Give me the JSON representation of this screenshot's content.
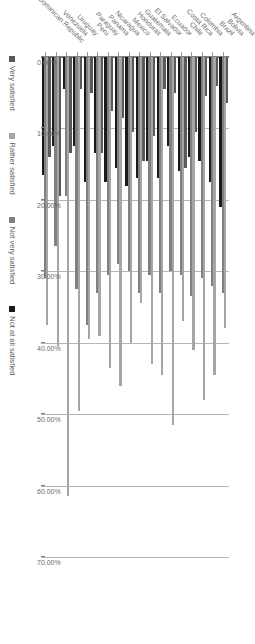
{
  "chart_data": {
    "type": "bar",
    "orientation": "vertical-grouped-rendered-sideways",
    "title": "",
    "subtitle": "",
    "xlabel": "",
    "ylabel": "",
    "ylim": [
      0,
      70
    ],
    "grid": true,
    "legend_position": "bottom",
    "tick_labels": [
      "0.00%",
      "10.00%",
      "20.00%",
      "30.00%",
      "40.00%",
      "50.00%",
      "60.00%",
      "70.00%"
    ],
    "tick_values": [
      0,
      10,
      20,
      30,
      40,
      50,
      60,
      70
    ],
    "categories": [
      "Argentina",
      "Bolivia",
      "Brazil",
      "Colombia",
      "Costa Rica",
      "Chile",
      "Ecuador",
      "El Salvador",
      "Guatemala",
      "Honduras",
      "Mexico",
      "Nicaragua",
      "Panama",
      "Paraguay",
      "Peru",
      "Uruguay",
      "Venezuela",
      "Dominican Republic"
    ],
    "series": [
      {
        "name": "Very satisfied",
        "color": "#595959",
        "values": [
          6.5,
          4.0,
          5.5,
          10.5,
          15.5,
          5.0,
          4.5,
          11.0,
          14.5,
          10.5,
          8.5,
          7.5,
          13.5,
          5.0,
          4.5,
          13.5,
          19.5,
          14.0
        ]
      },
      {
        "name": "Rather satisfied",
        "color": "#a6a6a6",
        "values": [
          38.0,
          44.5,
          48.0,
          41.0,
          37.0,
          51.5,
          44.5,
          43.0,
          34.5,
          40.0,
          46.0,
          43.5,
          39.0,
          39.5,
          49.5,
          61.5,
          40.5,
          37.5
        ]
      },
      {
        "name": "Not very satisfied",
        "color": "#808080",
        "values": [
          33.0,
          32.0,
          31.0,
          33.5,
          30.5,
          30.0,
          33.0,
          30.5,
          33.0,
          30.0,
          29.0,
          30.5,
          33.0,
          37.5,
          32.5,
          19.5,
          26.5,
          31.0
        ]
      },
      {
        "name": "Not at all satisfied",
        "color": "#1a1a1a",
        "values": [
          21.0,
          17.5,
          14.5,
          14.0,
          16.0,
          12.5,
          17.0,
          14.5,
          17.0,
          18.0,
          15.5,
          17.5,
          13.5,
          17.5,
          12.5,
          4.5,
          12.5,
          16.5
        ]
      }
    ]
  },
  "legend": {
    "items": [
      {
        "label": "Very satisfied",
        "color": "#595959"
      },
      {
        "label": "Rather satisfied",
        "color": "#a6a6a6"
      },
      {
        "label": "Not very satisfied",
        "color": "#808080"
      },
      {
        "label": "Not at all satisfied",
        "color": "#1a1a1a"
      }
    ]
  }
}
